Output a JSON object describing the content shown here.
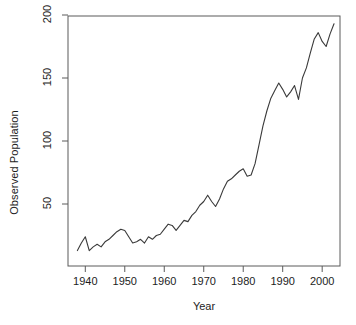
{
  "chart_data": {
    "type": "line",
    "title": "",
    "xlabel": "Year",
    "ylabel": "Observed Population",
    "xlim": [
      1938,
      2003
    ],
    "ylim": [
      10,
      200
    ],
    "grid": false,
    "legend": null,
    "xticks": [
      1940,
      1950,
      1960,
      1970,
      1980,
      1990,
      2000
    ],
    "yticks": [
      50,
      100,
      150,
      200
    ],
    "line_color": "#3a3a3a",
    "series": [
      {
        "name": "Observed Population",
        "x": [
          1938,
          1939,
          1940,
          1941,
          1942,
          1943,
          1944,
          1945,
          1946,
          1947,
          1948,
          1949,
          1950,
          1951,
          1952,
          1953,
          1954,
          1955,
          1956,
          1957,
          1958,
          1959,
          1960,
          1961,
          1962,
          1963,
          1964,
          1965,
          1966,
          1967,
          1968,
          1969,
          1970,
          1971,
          1972,
          1973,
          1974,
          1975,
          1976,
          1977,
          1978,
          1979,
          1980,
          1981,
          1982,
          1983,
          1984,
          1985,
          1986,
          1987,
          1988,
          1989,
          1990,
          1991,
          1992,
          1993,
          1994,
          1995,
          1996,
          1997,
          1998,
          1999,
          2000,
          2001,
          2002,
          2003
        ],
        "y": [
          13,
          19,
          24,
          13,
          16,
          18,
          16,
          20,
          22,
          25,
          28,
          30,
          29,
          24,
          19,
          20,
          22,
          19,
          24,
          22,
          25,
          26,
          30,
          34,
          33,
          29,
          33,
          37,
          36,
          41,
          44,
          49,
          52,
          57,
          52,
          48,
          54,
          62,
          68,
          70,
          73,
          76,
          78,
          72,
          73,
          82,
          97,
          112,
          124,
          134,
          140,
          146,
          141,
          135,
          139,
          144,
          133,
          150,
          158,
          170,
          181,
          186,
          179,
          175,
          185,
          193
        ]
      }
    ]
  },
  "axis": {
    "ylabel": "Observed Population",
    "xlabel": "Year"
  }
}
